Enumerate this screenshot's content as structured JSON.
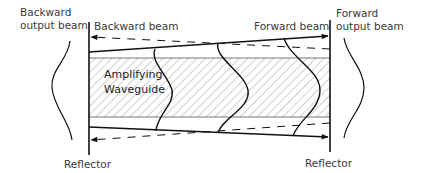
{
  "diagram": {
    "title": "",
    "labels": {
      "backward_output_line1": "Backward",
      "backward_output_line2": "output beam",
      "forward_output_line1": "Forward",
      "forward_output_line2": "output beam",
      "backward_beam": "Backward beam",
      "forward_beam": "Forward beam",
      "waveguide_line1": "Amplifying",
      "waveguide_line2": "Waveguide",
      "reflector_left": "Reflector",
      "reflector_right": "Reflector"
    },
    "colors": {
      "line": "#111111",
      "text": "#3a3a3a",
      "hatch": "#8a8a8a",
      "background": "#ffffff"
    }
  }
}
